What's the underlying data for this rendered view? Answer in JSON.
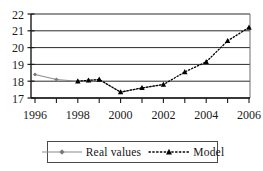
{
  "chart_data": {
    "type": "line",
    "title": "",
    "subtitle": "",
    "xlabel": "",
    "ylabel": "",
    "xlim": [
      1995.5,
      2006.5
    ],
    "ylim": [
      17,
      22
    ],
    "yticks": [
      17,
      18,
      19,
      20,
      21,
      22
    ],
    "ytick_labels": [
      "17",
      "18",
      "19",
      "20",
      "21",
      "22"
    ],
    "xticks": [
      1996,
      1997,
      1998,
      1999,
      2000,
      2001,
      2002,
      2003,
      2004,
      2005,
      2006
    ],
    "xtick_labels": [
      "1996",
      "",
      "1998",
      "",
      "2000",
      "",
      "2002",
      "",
      "2004",
      "",
      "2006"
    ],
    "xtick_labels_shown": [
      "1996",
      "1998",
      "2000",
      "2002",
      "2004",
      "2006"
    ],
    "grid": true,
    "grid_axis": "y",
    "legend_position": "bottom",
    "series": [
      {
        "name": "Real values",
        "color": "#8c8c8c",
        "line_style": "solid",
        "marker": "diamond",
        "x": [
          1996,
          1997,
          1998,
          1998.5,
          1999,
          2000,
          2001,
          2002
        ],
        "values": [
          18.4,
          18.1,
          18.0,
          18.05,
          18.1,
          17.35,
          17.6,
          17.8
        ]
      },
      {
        "name": "Model",
        "color": "#000000",
        "line_style": "dotted",
        "marker": "triangle",
        "x": [
          1998,
          1998.5,
          1999,
          2000,
          2001,
          2002,
          2003,
          2004,
          2005,
          2006
        ],
        "values": [
          18.0,
          18.05,
          18.1,
          17.35,
          17.6,
          17.8,
          18.55,
          19.15,
          20.4,
          21.2
        ]
      }
    ]
  },
  "legend": {
    "entries": [
      {
        "label": "Real values",
        "marker": "diamond-marker",
        "style": "solid"
      },
      {
        "label": "Model",
        "marker": "triangle-marker",
        "style": "dotted"
      }
    ]
  },
  "axes": {
    "y_labels": [
      "22",
      "21",
      "20",
      "19",
      "18",
      "17"
    ],
    "x_labels": [
      "1996",
      "1998",
      "2000",
      "2002",
      "2004",
      "2006"
    ]
  },
  "colors": {
    "real_values": "#8c8c8c",
    "model": "#000000",
    "grid": "#2b2b2b",
    "axis": "#1a1a1a",
    "background": "#ffffff"
  }
}
